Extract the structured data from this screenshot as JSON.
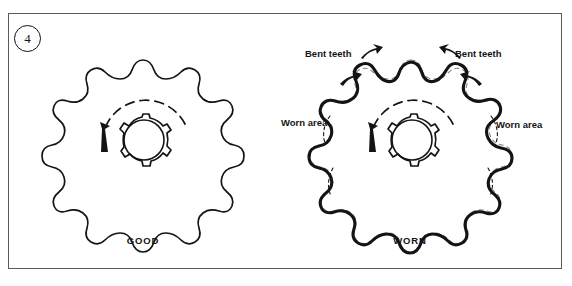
{
  "figure": {
    "step_number": "4",
    "background_color": "#ffffff",
    "border_color": "#5b5b5b",
    "ink_color": "#141414"
  },
  "captions": {
    "good": "GOOD",
    "worn": "WORN"
  },
  "annotations": {
    "bent_teeth_left": "Bent teeth",
    "bent_teeth_right": "Bent teeth",
    "worn_area_left": "Worn area",
    "worn_area_right": "Worn area"
  },
  "sprockets": [
    {
      "id": "good-sprocket",
      "label": "GOOD",
      "condition": "good",
      "tooth_count": 15,
      "center_x": 143,
      "center_y": 140,
      "outer_radius": 80,
      "root_radius": 54,
      "hub_radius": 26,
      "hub_spline_count": 7,
      "rotation_arrow": "counterclockwise",
      "stroke_width": 1.6
    },
    {
      "id": "worn-sprocket",
      "label": "WORN",
      "condition": "worn",
      "tooth_count": 15,
      "center_x": 411,
      "center_y": 140,
      "outer_radius": 80,
      "root_radius": 54,
      "hub_radius": 26,
      "hub_spline_count": 7,
      "rotation_arrow": "counterclockwise",
      "stroke_width": 3.0,
      "wear_markers": [
        "dashed-original-profile",
        "hooked-teeth"
      ]
    }
  ],
  "icons": {
    "rotation_arrow": "curved-arrow-counterclockwise-icon",
    "pointer_arrow": "pointer-arrow-icon"
  }
}
